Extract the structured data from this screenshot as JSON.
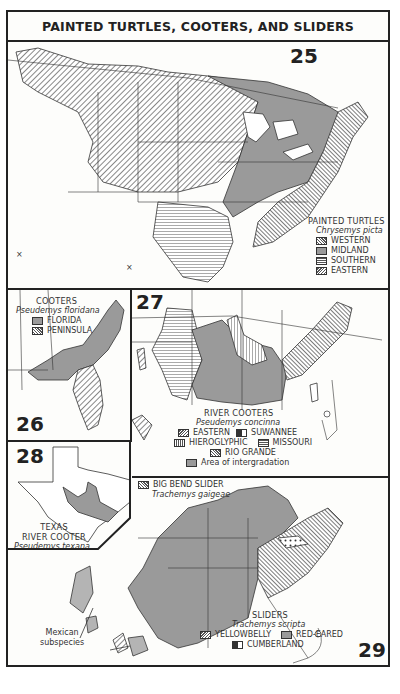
{
  "title": "PAINTED TURTLES, COOTERS, AND SLIDERS",
  "maps": {
    "m25": {
      "number": "25",
      "legend_title": "PAINTED TURTLES",
      "species": "Chrysemys picta",
      "items": [
        {
          "label": "WESTERN",
          "pattern": "diagonal"
        },
        {
          "label": "MIDLAND",
          "pattern": "gray"
        },
        {
          "label": "SOUTHERN",
          "pattern": "horizontal"
        },
        {
          "label": "EASTERN",
          "pattern": "reverse-diagonal"
        }
      ]
    },
    "m26": {
      "number": "26",
      "legend_title": "COOTERS",
      "species": "Pseudemys floridana",
      "items": [
        {
          "label": "FLORIDA",
          "pattern": "gray"
        },
        {
          "label": "PENINSULA",
          "pattern": "diagonal"
        }
      ]
    },
    "m27": {
      "number": "27",
      "legend_title": "RIVER COOTERS",
      "species": "Pseudemys concinna",
      "items": [
        {
          "label": "EASTERN",
          "pattern": "reverse-diagonal"
        },
        {
          "label": "SUWANNEE",
          "pattern": "checker"
        },
        {
          "label": "HIEROGLYPHIC",
          "pattern": "vertical"
        },
        {
          "label": "MISSOURI",
          "pattern": "horizontal"
        },
        {
          "label": "RIO GRANDE",
          "pattern": "diagonal"
        },
        {
          "label": "Area of intergradation",
          "pattern": "gray"
        }
      ]
    },
    "m28": {
      "number": "28",
      "legend_title_1": "TEXAS",
      "legend_title_2": "RIVER COOTER",
      "species": "Pseudemys texana"
    },
    "m29": {
      "number": "29",
      "bigbend_title": "BIG BEND SLIDER",
      "bigbend_species": "Trachemys gaigeae",
      "legend_title": "SLIDERS",
      "species": "Trachemys scripta",
      "items": [
        {
          "label": "YELLOWBELLY",
          "pattern": "reverse-diagonal"
        },
        {
          "label": "RED-EARED",
          "pattern": "gray"
        },
        {
          "label": "CUMBERLAND",
          "pattern": "checker"
        }
      ],
      "mexican_note_1": "Mexican",
      "mexican_note_2": "subspecies"
    }
  }
}
